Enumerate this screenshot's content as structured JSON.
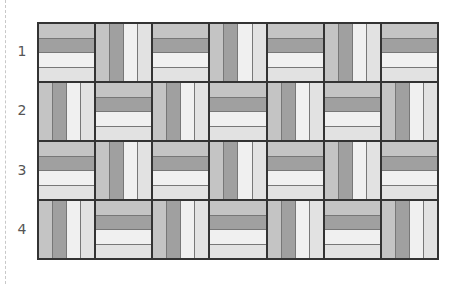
{
  "rows": [
    {
      "label": "1",
      "blocks": [
        "H",
        "V",
        "H",
        "V",
        "H",
        "V",
        "H"
      ]
    },
    {
      "label": "2",
      "blocks": [
        "V",
        "H",
        "V",
        "H",
        "V",
        "H",
        "V"
      ]
    },
    {
      "label": "3",
      "blocks": [
        "H",
        "V",
        "H",
        "V",
        "H",
        "V",
        "H"
      ]
    },
    {
      "label": "4",
      "blocks": [
        "V",
        "H",
        "V",
        "H",
        "V",
        "H",
        "V"
      ]
    }
  ],
  "strip_colors": [
    "#c4c4c4",
    "#a0a0a0",
    "#f0f0f0",
    "#e2e2e2"
  ],
  "border_color": "#333333"
}
